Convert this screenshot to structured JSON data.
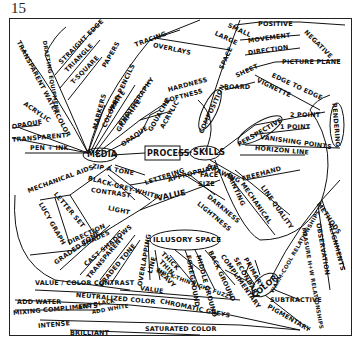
{
  "page_number": "15",
  "hubs": {
    "media": "MEDIA",
    "process": "PROCESS",
    "skills": "SKILLS",
    "composition": "COMPOSITION",
    "perspective": "PERSPECTIVE",
    "illusory_space": "ILLUSORY SPACE",
    "color": "COLOR",
    "rendering": "RENDERING",
    "value": "VALUE",
    "space": "SPACE",
    "drawing": "DRAWING",
    "painting": "PAINTING",
    "light": "LIGHT",
    "lettering": "LETTERING",
    "mechanical_aids": "MECHANICAL AIDS",
    "methods": "METHODS"
  },
  "media_branch": [
    "TRANSPARENT WATERCOLOR",
    "DRAFTING EQUIPMENT",
    "STRAIGHT EDGE",
    "TRIANGLE",
    "T-SQUARE",
    "PAPERS",
    "TRACING",
    "OVERLAYS",
    "MARKERS",
    "COLORED PENCILS",
    "PHOTOGRAPHY",
    "WHITE",
    "GRAPHITE",
    "HARDNESS",
    "SOFTNESS",
    "OPAQUE",
    "GOUACHE",
    "ACRYLIC",
    "ACRYLIC",
    "OPAQUE",
    "TRANSPARENT",
    "PEN + INK"
  ],
  "space_branch": [
    "SMALL",
    "LARGE",
    "POSITIVE",
    "NEGATIVE",
    "MOVEMENT",
    "DIRECTION",
    "SHEET",
    "PICTURE PLANE",
    "EDGE TO EDGE",
    "VIGNETTE",
    "BOARD"
  ],
  "perspective_branch": [
    "2 POINT",
    "1 POINT",
    "VANISHING POINTS",
    "HORIZON LINE"
  ],
  "drawing_branch": [
    "FREEHAND",
    "MECHANICAL",
    "LINE QUALITY"
  ],
  "methods_branch": [
    "OBSERVATION",
    "ALIGNMENTS",
    "MEASURE H+W RELATIONSHIPS"
  ],
  "mechanical_aids_branch": [
    "ZIP A TONE",
    "LETTER SET",
    "LUCY GRAPH"
  ],
  "value_branch": [
    "BLACK-GREY-WHITE",
    "CONTRAST",
    "DARKNESS",
    "LIGHTNESS",
    "DIRECTION",
    "SHADES",
    "GRADED TONE",
    "CAST SHADOWS",
    "TRANSPARENT",
    "GRADED TONE"
  ],
  "lettering_branch": [
    "APPROPRIATE",
    "FACE",
    "SIZE"
  ],
  "illusory_space_branch": [
    "OVERLAPPING",
    "LINE",
    "THICK",
    "THIN",
    "HEAVY",
    "THICK-THIN LIGHT FUZZY",
    "FOREGROUND",
    "MIDDLE GROUND",
    "BACK GROUND"
  ],
  "color_branch": [
    "PRIMARY",
    "SECONDARY",
    "COMPLIMENTARY",
    "WARM-COOL RELATIONSHIPS",
    "SUBTRACTIVE",
    "PIGMENTARY",
    "VALUE / COLOR CONTRAST",
    "VALUE",
    "NEUTRALIZED COLOR",
    "ADD WATER",
    "MIXING COMPLIMENTS",
    "ADD BLACK",
    "ADD WHITE",
    "CHROMATIC GREYS",
    "INTENSE",
    "BRILLIANT",
    "SATURATED COLOR"
  ]
}
